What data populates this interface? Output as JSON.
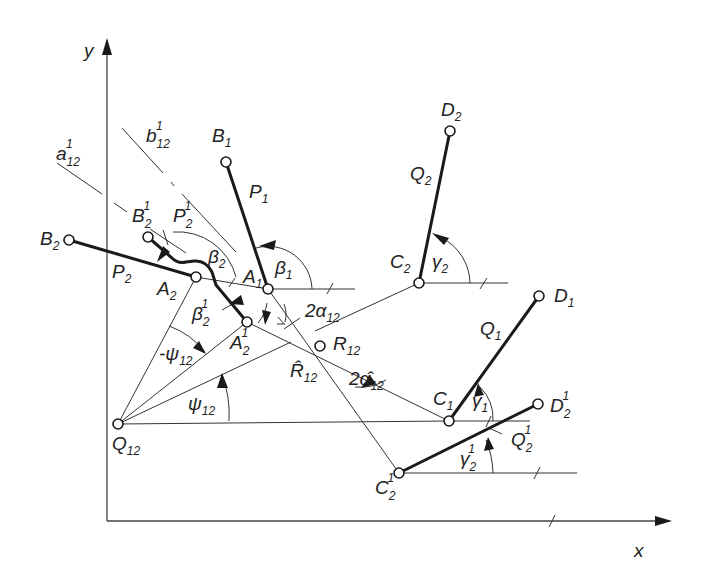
{
  "diagram": {
    "axes": {
      "x_label": "x",
      "y_label": "y",
      "origin": [
        107,
        521
      ],
      "x_end": [
        672,
        521
      ],
      "y_end": [
        107,
        38
      ]
    },
    "points": {
      "Q12": {
        "name": "Q",
        "sub": "12",
        "sup": "",
        "xy": [
          118,
          424
        ]
      },
      "A2": {
        "name": "A",
        "sub": "2",
        "sup": "",
        "xy": [
          196,
          277
        ]
      },
      "A1": {
        "name": "A",
        "sub": "1",
        "sup": "",
        "xy": [
          268,
          289
        ]
      },
      "A2p": {
        "name": "A",
        "sub": "2",
        "sup": "1",
        "xy": [
          247,
          322
        ]
      },
      "R12": {
        "name": "R",
        "sub": "12",
        "sup": "",
        "xy": [
          320,
          346
        ]
      },
      "B1": {
        "name": "B",
        "sub": "1",
        "sup": "",
        "xy": [
          226,
          162
        ]
      },
      "B2": {
        "name": "B",
        "sub": "2",
        "sup": "",
        "xy": [
          69,
          240
        ]
      },
      "B2p": {
        "name": "B",
        "sub": "2",
        "sup": "1",
        "xy": [
          148,
          237
        ]
      },
      "C2": {
        "name": "C",
        "sub": "2",
        "sup": "",
        "xy": [
          419,
          283
        ]
      },
      "D2": {
        "name": "D",
        "sub": "2",
        "sup": "",
        "xy": [
          450,
          131
        ]
      },
      "C1": {
        "name": "C",
        "sub": "1",
        "sup": "",
        "xy": [
          449,
          421
        ]
      },
      "D1": {
        "name": "D",
        "sub": "1",
        "sup": "",
        "xy": [
          539,
          296
        ]
      },
      "C2p": {
        "name": "C",
        "sub": "2",
        "sup": "1",
        "xy": [
          399,
          473
        ]
      },
      "D2p": {
        "name": "D",
        "sub": "2",
        "sup": "1",
        "xy": [
          538,
          404
        ]
      }
    },
    "links": {
      "P1": {
        "name": "P",
        "sub": "1",
        "sup": ""
      },
      "P2": {
        "name": "P",
        "sub": "2",
        "sup": ""
      },
      "P2p": {
        "name": "P",
        "sub": "2",
        "sup": "1"
      },
      "Q1": {
        "name": "Q",
        "sub": "1",
        "sup": ""
      },
      "Q2": {
        "name": "Q",
        "sub": "2",
        "sup": ""
      },
      "Q2p": {
        "name": "Q",
        "sub": "2",
        "sup": "1"
      }
    },
    "angles": {
      "beta1": {
        "name": "β",
        "sub": "1",
        "sup": ""
      },
      "beta2": {
        "name": "β",
        "sub": "2",
        "sup": ""
      },
      "beta2p": {
        "name": "β",
        "sub": "2",
        "sup": "1"
      },
      "gamma1": {
        "name": "γ",
        "sub": "1",
        "sup": ""
      },
      "gamma2": {
        "name": "γ",
        "sub": "2",
        "sup": ""
      },
      "gamma2p": {
        "name": "γ",
        "sub": "2",
        "sup": "1"
      },
      "psi12": {
        "name": "ψ",
        "sub": "12",
        "sup": ""
      },
      "neg_psi12": {
        "name": "-ψ",
        "sub": "12",
        "sup": ""
      },
      "two_alpha12": {
        "name": "2α",
        "sub": "12",
        "sup": ""
      },
      "two_alpha12_hat": {
        "name": "2α̂",
        "sub": "12",
        "sup": ""
      }
    },
    "lines": {
      "a12p": {
        "name": "a",
        "sub": "12",
        "sup": "1"
      },
      "b12p": {
        "name": "b",
        "sub": "12",
        "sup": "1"
      },
      "R12_hat": {
        "name": "R̂",
        "sub": "12",
        "sup": ""
      }
    }
  }
}
